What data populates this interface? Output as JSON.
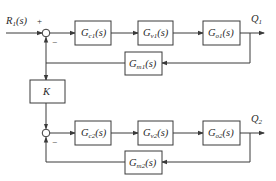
{
  "diagram": {
    "type": "block-diagram",
    "input": {
      "label": "R",
      "sub": "1",
      "arg": "(s)"
    },
    "outputs": [
      {
        "label": "Q",
        "sub": "1"
      },
      {
        "label": "Q",
        "sub": "2"
      }
    ],
    "signs": {
      "plus": "+",
      "minus": "−"
    },
    "loop1": {
      "blocks": [
        {
          "id": "Gc1",
          "base": "G",
          "sub": "c1",
          "arg": "(s)"
        },
        {
          "id": "Gv1",
          "base": "G",
          "sub": "v1",
          "arg": "(s)"
        },
        {
          "id": "Go1",
          "base": "G",
          "sub": "o1",
          "arg": "(s)"
        }
      ],
      "feedback": {
        "id": "Gm1",
        "base": "G",
        "sub": "m1",
        "arg": "(s)"
      }
    },
    "coupling": {
      "id": "K",
      "label": "K"
    },
    "loop2": {
      "blocks": [
        {
          "id": "Gc2",
          "base": "G",
          "sub": "c2",
          "arg": "(s)"
        },
        {
          "id": "Gv2",
          "base": "G",
          "sub": "v2",
          "arg": "(s)"
        },
        {
          "id": "Go2",
          "base": "G",
          "sub": "o2",
          "arg": "(s)"
        }
      ],
      "feedback": {
        "id": "Gm2",
        "base": "G",
        "sub": "m2",
        "arg": "(s)"
      }
    },
    "colors": {
      "line": "#3a3a3a",
      "text": "#2a2a2a",
      "background": "#ffffff"
    }
  }
}
